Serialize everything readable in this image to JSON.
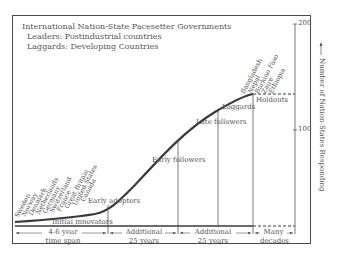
{
  "title": "International Nation-State Pacesetter Governments",
  "subtitles": [
    "Leaders: Postindustrial countries",
    "Laggards: Developing Countries"
  ],
  "stages": [
    {
      "label": "Initial innovators"
    },
    {
      "label": "Early adopters"
    },
    {
      "label": "Early followers"
    },
    {
      "label": "Late followers"
    },
    {
      "label": "Laggards"
    },
    {
      "label": "Holdouts"
    }
  ],
  "leader_countries": [
    "Sweden",
    "Norway",
    "Denmark",
    "Netherlands",
    "Germany",
    "Switzerland",
    "France",
    "Great Britain",
    "United States",
    "Canada"
  ],
  "laggard_countries": [
    "Bangladesh",
    "Nepal",
    "Burkino Faso",
    "Zaire",
    "Ethiopia"
  ],
  "time_spans": [
    {
      "line1": "4-6 year",
      "line2": "time span"
    },
    {
      "line1": "Additional",
      "line2": "25 years"
    },
    {
      "line1": "Additional",
      "line2": "25 years"
    },
    {
      "line1": "Many",
      "line2": "decades"
    }
  ],
  "y_axis": {
    "label": "Number of Nation-States Responding",
    "ticks": [
      "200",
      "100"
    ]
  },
  "colors": {
    "line": "#3a3a3a",
    "frame": "#4a4a4a",
    "text": "#555555"
  }
}
